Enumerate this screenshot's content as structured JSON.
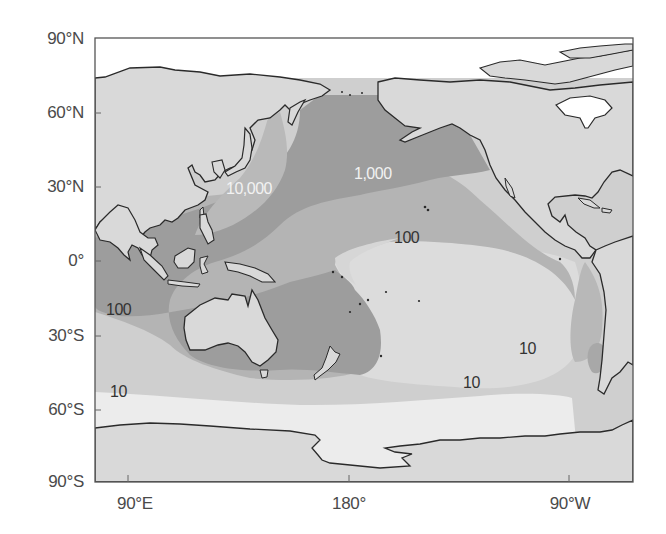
{
  "figure": {
    "type": "shaded contour map",
    "projection": "equirectangular, Pacific-centered",
    "lon_range": [
      "~75°E",
      "~50°W"
    ],
    "lat_range": [
      "90°N",
      "90°S"
    ]
  },
  "axes": {
    "y_ticks": [
      "90°N",
      "60°N",
      "30°N",
      "0°",
      "30°S",
      "60°S",
      "90°S"
    ],
    "x_ticks": [
      "90°E",
      "180°",
      "90°W"
    ]
  },
  "contours": {
    "levels": [
      "10",
      "100",
      "1,000",
      "10,000"
    ],
    "labels": [
      {
        "text": "10,000",
        "style": "light",
        "position": "off Japan / East China Sea"
      },
      {
        "text": "1,000",
        "style": "light",
        "position": "North Pacific, ~30°N 160°W"
      },
      {
        "text": "100",
        "style": "dark",
        "position": "central Pacific, ~10°N 150°W"
      },
      {
        "text": "100",
        "style": "dark",
        "position": "eastern Indian Ocean, ~20°S"
      },
      {
        "text": "10",
        "style": "dark",
        "position": "southeast Pacific, ~35°S 100°W"
      },
      {
        "text": "10",
        "style": "dark",
        "position": "South Pacific, ~50°S 140°W"
      },
      {
        "text": "10",
        "style": "dark",
        "position": "southern Indian Ocean, ~55°S"
      }
    ]
  },
  "colors": {
    "background": "#ffffff",
    "land": "#d9d9d9",
    "ice_white": "#ffffff",
    "level_lt10": "#ececec",
    "level_10_100": "#cfcfcf",
    "level_100_1000": "#b4b4b4",
    "level_1000_10000": "#9d9d9d",
    "level_gt10000": "#b9b9b9",
    "coastline": "#2a2a2a",
    "frame": "#555555",
    "axis_text": "#4a4a4a"
  }
}
